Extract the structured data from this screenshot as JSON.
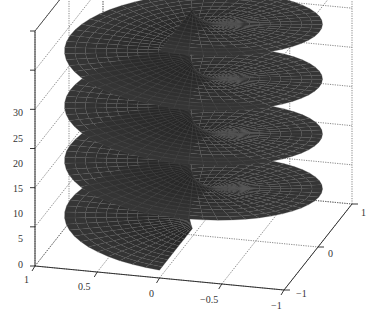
{
  "chart_data": {
    "type": "surface3d",
    "title": "ln z",
    "xlabel": "",
    "ylabel": "",
    "zlabel": "",
    "x_ticks": [
      "1",
      "0.5",
      "0",
      "-0.5",
      "-1"
    ],
    "y_ticks": [
      "-1",
      "0",
      "1"
    ],
    "z_ticks": [
      "0",
      "5",
      "10",
      "15",
      "20",
      "25",
      "30"
    ],
    "xlim": [
      -1,
      1
    ],
    "ylim": [
      -1,
      1
    ],
    "zlim": [
      0,
      30
    ],
    "turns": 4,
    "surface_color": "#2a2a2a",
    "mesh_color": "#555555",
    "grid": true,
    "box": true,
    "legend": null
  },
  "labels": {
    "title": "ln z",
    "z_ticks": [
      "0",
      "5",
      "10",
      "15",
      "20",
      "25",
      "30"
    ],
    "x_ticks": [
      "1",
      "0.5",
      "0",
      "−0.5",
      "−1"
    ],
    "y_ticks": [
      "−1",
      "0",
      "1"
    ]
  }
}
